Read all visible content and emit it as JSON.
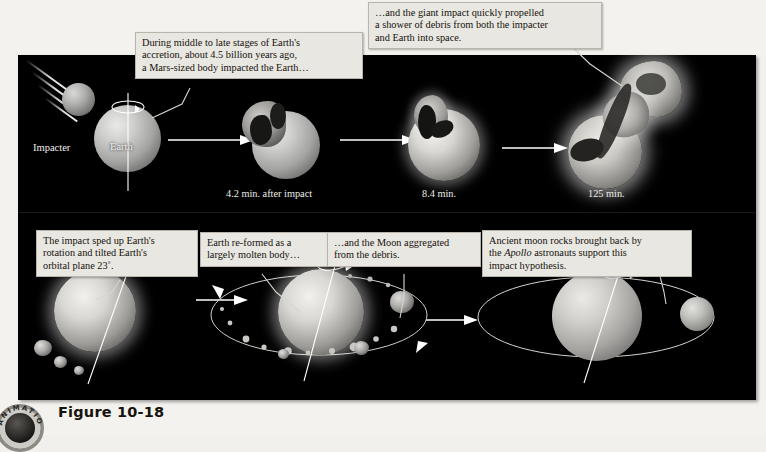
{
  "figure": {
    "caption": "Figure 10-18",
    "badge_text": "ANIMATION"
  },
  "callouts": [
    {
      "id": "impact-callout",
      "lines": [
        "During middle to late stages of Earth's",
        "accretion, about 4.5 billion years ago,",
        "a Mars-sized body impacted the Earth…"
      ]
    },
    {
      "id": "debris-callout",
      "lines": [
        "…and the giant impact quickly propelled",
        "a shower of debris from both the impacter",
        "and Earth into space."
      ]
    },
    {
      "id": "rotation-callout",
      "lines": [
        "The impact sped up Earth's",
        "rotation and tilted Earth's",
        "orbital plane 23˚."
      ]
    },
    {
      "id": "molten-callout",
      "lines": [
        "Earth re-formed as a",
        "largely molten body…"
      ]
    },
    {
      "id": "moon-callout",
      "lines": [
        "…and the Moon aggregated",
        "from the debris."
      ]
    },
    {
      "id": "apollo-callout",
      "lines_rich": [
        "Ancient moon rocks brought back by",
        "the <i>Apollo</i> astronauts support this",
        "impact hypothesis."
      ]
    }
  ],
  "top_row": {
    "impacter_label": "Impacter",
    "earth_label": "Earth",
    "stages": [
      {
        "time_label": "4.2 min. after impact"
      },
      {
        "time_label": "8.4 min."
      },
      {
        "time_label": "125 min."
      }
    ]
  },
  "colors": {
    "panel_background": "#000000",
    "page_background": "#f4f2ee",
    "callout_background": "#e9e7e1",
    "callout_border": "#b9b5ac",
    "arrow": "#ffffff",
    "label_text": "#f0efec",
    "caption_text": "#16130f"
  }
}
